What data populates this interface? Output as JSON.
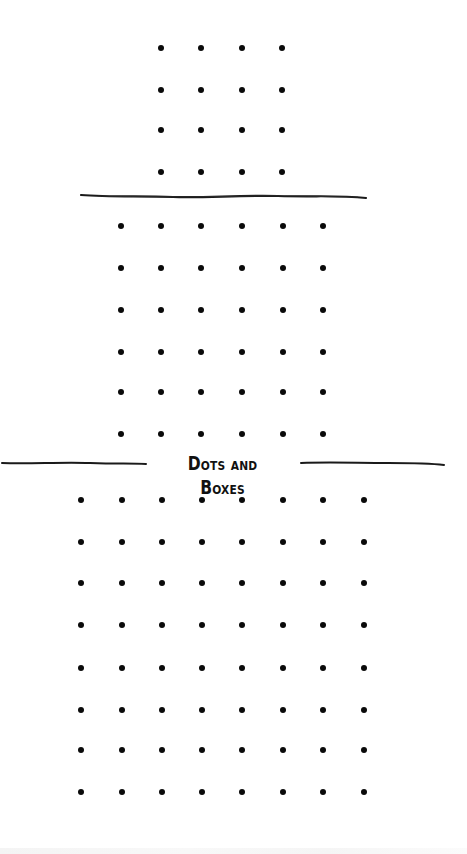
{
  "title": "Dots and Boxes",
  "colors": {
    "dot": "#0a0a0a",
    "line": "#1a1a1a",
    "background": "#ffffff"
  },
  "boards": [
    {
      "name": "board-4x4",
      "rows": 4,
      "cols": 4,
      "xs": [
        161,
        201,
        242,
        282
      ],
      "ys": [
        48,
        90,
        130,
        172
      ]
    },
    {
      "name": "board-6x6",
      "rows": 6,
      "cols": 6,
      "xs": [
        121,
        161,
        201,
        242,
        283,
        323
      ],
      "ys": [
        226,
        268,
        310,
        352,
        392,
        434
      ]
    },
    {
      "name": "board-8x8",
      "rows": 8,
      "cols": 8,
      "xs": [
        81,
        122,
        162,
        202,
        242,
        283,
        323,
        364
      ],
      "ys": [
        500,
        542,
        583,
        625,
        668,
        710,
        750,
        792
      ]
    }
  ]
}
